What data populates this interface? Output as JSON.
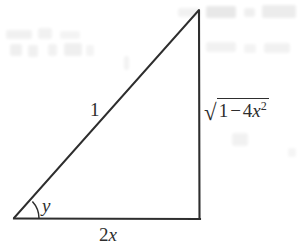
{
  "figure": {
    "kind": "right-triangle-diagram",
    "ink_color": "#2e2e2e",
    "background_color": "#ffffff"
  },
  "geometry": {
    "vertex_left": {
      "x": 14,
      "y": 218
    },
    "vertex_right": {
      "x": 200,
      "y": 219
    },
    "vertex_apex": {
      "x": 199,
      "y": 10
    },
    "angle_arc_radius": 25,
    "stroke_width": 1.9
  },
  "labels": {
    "hypotenuse": "1",
    "angle": "y",
    "base_coefficient": "2",
    "base_variable": "x",
    "vertical_radical_symbol": "√",
    "vertical_radicand_first": "1",
    "vertical_radicand_operator": "−",
    "vertical_radicand_coefficient": "4",
    "vertical_radicand_variable": "x",
    "vertical_radicand_exponent": "2"
  }
}
